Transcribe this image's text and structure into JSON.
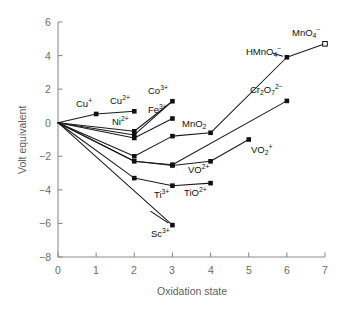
{
  "chart_data": {
    "type": "line",
    "title": "",
    "xlabel": "Oxidation state",
    "ylabel": "Volt equivalent",
    "xlim": [
      0,
      7
    ],
    "ylim": [
      -8,
      6
    ],
    "xticks": [
      0,
      1,
      2,
      3,
      4,
      5,
      6,
      7
    ],
    "yticks": [
      -8,
      -6,
      -4,
      -2,
      0,
      2,
      4,
      6
    ],
    "xtick_labels": [
      "0",
      "1",
      "2",
      "3",
      "4",
      "5",
      "6",
      "7"
    ],
    "ytick_labels": [
      "-8",
      "-6",
      "-4",
      "-2",
      "0",
      "2",
      "4",
      "6"
    ],
    "grid": false,
    "legend": "none",
    "marker": "filled-square",
    "line_color": "#111111",
    "axis_color": "#8c8c8c",
    "series": [
      {
        "name": "Cu",
        "x": [
          0,
          1,
          2
        ],
        "values": [
          0,
          0.52,
          0.68
        ]
      },
      {
        "name": "Ni",
        "x": [
          0,
          2,
          3
        ],
        "values": [
          0,
          -0.51,
          1.28
        ]
      },
      {
        "name": "Co",
        "x": [
          0,
          2,
          3
        ],
        "values": [
          0,
          -0.73,
          1.28
        ]
      },
      {
        "name": "Fe",
        "x": [
          0,
          2,
          3
        ],
        "values": [
          0,
          -0.91,
          0.25
        ]
      },
      {
        "name": "Mn",
        "x": [
          0,
          2,
          3,
          4,
          6,
          7
        ],
        "values": [
          0,
          -2.0,
          -0.8,
          -0.6,
          3.9,
          4.7
        ]
      },
      {
        "name": "Cr",
        "x": [
          0,
          2,
          3,
          6
        ],
        "values": [
          0,
          -2.3,
          -2.5,
          1.3
        ]
      },
      {
        "name": "V",
        "x": [
          0,
          2,
          3,
          4,
          5
        ],
        "values": [
          0,
          -2.3,
          -2.55,
          -2.3,
          -1.0
        ]
      },
      {
        "name": "Ti",
        "x": [
          0,
          2,
          3,
          4
        ],
        "values": [
          0,
          -3.3,
          -3.75,
          -3.6
        ]
      },
      {
        "name": "Sc",
        "x": [
          0,
          3
        ],
        "values": [
          0,
          -6.1
        ]
      }
    ],
    "point_labels": [
      {
        "text_html": "Cu<sup>+</sup>",
        "plain": "Cu+",
        "x": 1,
        "y": 0.52
      },
      {
        "text_html": "Cu<sup>2+</sup>",
        "plain": "Cu2+",
        "x": 2,
        "y": 0.68
      },
      {
        "text_html": "Ni<sup>2+</sup>",
        "plain": "Ni2+",
        "x": 2,
        "y": -0.51
      },
      {
        "text_html": "Co<sup>3+</sup>",
        "plain": "Co3+",
        "x": 3,
        "y": 1.28
      },
      {
        "text_html": "Fe<sup>3+</sup>",
        "plain": "Fe3+",
        "x": 3,
        "y": 0.25
      },
      {
        "text_html": "MnO<sub>2</sub>",
        "plain": "MnO2",
        "x": 4,
        "y": -0.6
      },
      {
        "text_html": "VO<sup>2+</sup>",
        "plain": "VO2+",
        "x": 4,
        "y": -2.3
      },
      {
        "text_html": "VO<sub>2</sub><sup>+</sup>",
        "plain": "VO2+",
        "x": 5,
        "y": -1.0
      },
      {
        "text_html": "Cr<sub>2</sub>O<sub>7</sub><sup>2−</sup>",
        "plain": "Cr2O7 2-",
        "x": 6,
        "y": 1.3
      },
      {
        "text_html": "HMnO<sub>4</sub><sup>−</sup>",
        "plain": "HMnO4-",
        "x": 6,
        "y": 3.9
      },
      {
        "text_html": "MnO<sub>4</sub><sup>−</sup>",
        "plain": "MnO4-",
        "x": 7,
        "y": 4.7
      },
      {
        "text_html": "Ti<sup>3+</sup>",
        "plain": "Ti3+",
        "x": 3,
        "y": -3.75
      },
      {
        "text_html": "TiO<sup>2+</sup>",
        "plain": "TiO2+",
        "x": 4,
        "y": -3.6
      },
      {
        "text_html": "Sc<sup>3+</sup>",
        "plain": "Sc3+",
        "x": 3,
        "y": -6.1
      }
    ]
  },
  "axes": {
    "xlabel": "Oxidation state",
    "ylabel": "Volt equivalent"
  }
}
